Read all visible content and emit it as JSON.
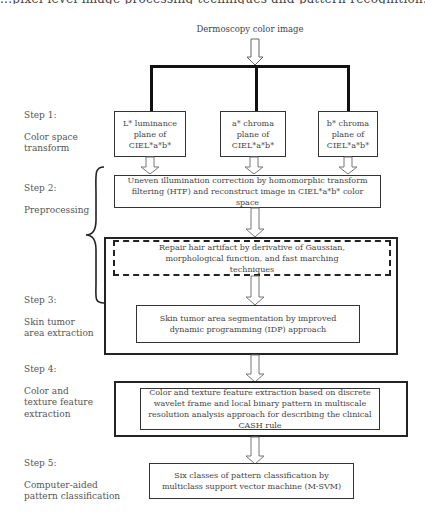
{
  "diagram": {
    "top_cut_text": "...pixel-level image processing techniques and pattern recognition...",
    "input": "Dermoscopy color image",
    "steps": [
      {
        "step_label": "Step 1:",
        "name": "Color space transform"
      },
      {
        "step_label": "Step 2:",
        "name": "Preprocessing"
      },
      {
        "step_label": "Step 3:",
        "name": "Skin tumor area extraction"
      },
      {
        "step_label": "Step 4:",
        "name": "Color and texture feature extraction"
      },
      {
        "step_label": "Step 5:",
        "name": "Computer-aided pattern classification"
      }
    ],
    "planes": [
      {
        "line1": "L* luminance",
        "line2": "plane of",
        "line3": "CIEL*a*b*"
      },
      {
        "line1": "a* chroma",
        "line2": "plane of",
        "line3": "CIEL*a*b*"
      },
      {
        "line1": "b* chroma",
        "line2": "plane of",
        "line3": "CIEL*a*b*"
      }
    ],
    "preprocess_box": "Uneven illumination correction by homomorphic transform filtering (HTF) and reconstruct image in CIEL*a*b* color space",
    "hair_box": "Repair hair artifact by derivative of Gaussian, morphological function, and fast marching techniques",
    "segmentation_box": "Skin tumor area segmentation by improved dynamic programming (IDP) approach",
    "feature_box": "Color and texture feature extraction based on discrete wavelet frame and local binary pattern in multiscale resolution analysis approach for describing the clinical CASH rule",
    "classification_box": "Six classes of pattern classification by multiclass support vector machine (M-SVM)"
  }
}
